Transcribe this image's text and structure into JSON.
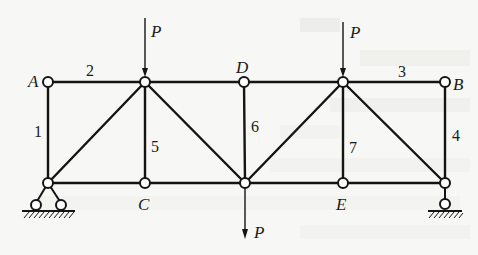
{
  "figure": {
    "type": "plane truss",
    "nodes": {
      "A": {
        "label": "A",
        "x": 48,
        "y": 82
      },
      "T2": {
        "label": "",
        "x": 145,
        "y": 82
      },
      "D": {
        "label": "D",
        "x": 244,
        "y": 82
      },
      "T4": {
        "label": "",
        "x": 343,
        "y": 82
      },
      "B": {
        "label": "B",
        "x": 445,
        "y": 82
      },
      "L1": {
        "label": "",
        "x": 48,
        "y": 183
      },
      "C": {
        "label": "C",
        "x": 145,
        "y": 183
      },
      "M": {
        "label": "",
        "x": 245,
        "y": 183
      },
      "E": {
        "label": "E",
        "x": 343,
        "y": 183
      },
      "R1": {
        "label": "",
        "x": 445,
        "y": 183
      }
    },
    "member_labels": [
      "1",
      "2",
      "3",
      "4",
      "5",
      "6",
      "7"
    ],
    "loads": [
      {
        "label": "P",
        "at": "T2",
        "direction": "down"
      },
      {
        "label": "P",
        "at": "T4",
        "direction": "down"
      },
      {
        "label": "P",
        "at": "M",
        "direction": "down"
      }
    ],
    "supports": [
      {
        "at": "L1",
        "type": "fixed pin (two-roller base)"
      },
      {
        "at": "R1",
        "type": "roller"
      }
    ]
  }
}
